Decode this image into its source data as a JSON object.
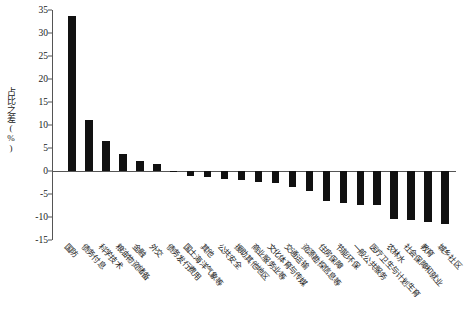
{
  "chart_data": {
    "type": "bar",
    "title": "",
    "subtitle": "",
    "xlabel": "",
    "ylabel": "占比之差(%)",
    "ylim": [
      -15,
      35
    ],
    "ytick_values": [
      35,
      30,
      25,
      20,
      15,
      10,
      5,
      0,
      -5,
      -10,
      -15
    ],
    "ytick_labels": [
      "35",
      "30",
      "25",
      "20",
      "15",
      "10",
      "5",
      "0",
      "-5",
      "-10",
      "-15"
    ],
    "grid": false,
    "legend": null,
    "bar_color": "#111111",
    "axis_color": "#555555",
    "categories": [
      "国防",
      "债务付息",
      "科学技术",
      "粮油物资储备",
      "金融",
      "外交",
      "债务发行费用",
      "国土海洋气象等",
      "其他",
      "公共安全",
      "援助其他地区",
      "商业服务业等",
      "文化体育与传媒",
      "交通运输",
      "资源勘探信息等",
      "住房保障",
      "节能环保",
      "一般公共服务",
      "医疗卫生与计划生育",
      "农林水",
      "社会保障和就业",
      "教育",
      "城乡社区"
    ],
    "values": [
      33.6,
      11.0,
      6.6,
      3.7,
      2.2,
      1.6,
      -0.3,
      -1.0,
      -1.4,
      -1.8,
      -2.0,
      -2.3,
      -2.5,
      -3.4,
      -4.3,
      -6.5,
      -7.0,
      -7.3,
      -7.4,
      -10.5,
      -10.6,
      -11.1,
      -11.5
    ]
  }
}
